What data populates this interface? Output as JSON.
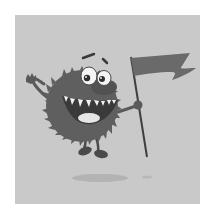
{
  "image": {
    "subject": "Cartoon fuzzy germ monster waving and holding a flag",
    "style": "grayscale illustration",
    "colors": {
      "page_bg": "#ffffff",
      "panel_bg": "#c9c9c9",
      "body": "#5f5f5f",
      "body_dark": "#4a4a4a",
      "flag": "#6a6a6a",
      "pole": "#3f3f3f",
      "eyes": "#f4f4f4",
      "teeth": "#f2f2f2",
      "tongue": "#e6e6e6",
      "shadow": "#b3b3b3"
    }
  }
}
